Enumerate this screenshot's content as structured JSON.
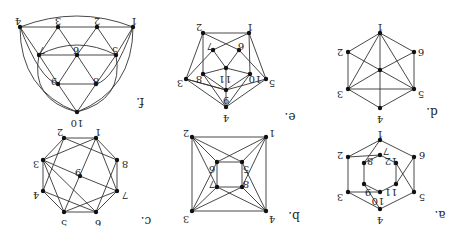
{
  "orientation": "rotated-180",
  "style": {
    "edge_color": "#333333",
    "node_color": "#111111",
    "background": "#ffffff"
  },
  "graphs": [
    {
      "id": "a",
      "caption": "a.",
      "caption_pos": [
        440,
        214
      ],
      "nodes": [
        {
          "id": "1",
          "x": 380,
          "y": 140,
          "lx": 380,
          "ly": 133
        },
        {
          "id": "2",
          "x": 348,
          "y": 157,
          "lx": 340,
          "ly": 154
        },
        {
          "id": "6",
          "x": 414,
          "y": 157,
          "lx": 422,
          "ly": 154
        },
        {
          "id": "7",
          "x": 380,
          "y": 155,
          "lx": 386,
          "ly": 150
        },
        {
          "id": "8",
          "x": 364,
          "y": 163,
          "lx": 370,
          "ly": 160
        },
        {
          "id": "12",
          "x": 396,
          "y": 163,
          "lx": 391,
          "ly": 160
        },
        {
          "id": "11",
          "x": 396,
          "y": 184,
          "lx": 391,
          "ly": 191
        },
        {
          "id": "9",
          "x": 364,
          "y": 184,
          "lx": 368,
          "ly": 191
        },
        {
          "id": "10",
          "x": 380,
          "y": 192,
          "lx": 378,
          "ly": 200
        },
        {
          "id": "3",
          "x": 348,
          "y": 192,
          "lx": 340,
          "ly": 196
        },
        {
          "id": "5",
          "x": 414,
          "y": 192,
          "lx": 422,
          "ly": 196
        },
        {
          "id": "4",
          "x": 380,
          "y": 209,
          "lx": 380,
          "ly": 219
        }
      ],
      "edges": [
        [
          "1",
          "2"
        ],
        [
          "1",
          "6"
        ],
        [
          "2",
          "3"
        ],
        [
          "6",
          "5"
        ],
        [
          "3",
          "4"
        ],
        [
          "5",
          "4"
        ],
        [
          "7",
          "8"
        ],
        [
          "7",
          "12"
        ],
        [
          "8",
          "9"
        ],
        [
          "12",
          "11"
        ],
        [
          "9",
          "10"
        ],
        [
          "11",
          "10"
        ],
        [
          "1",
          "8"
        ],
        [
          "2",
          "7"
        ],
        [
          "6",
          "11"
        ],
        [
          "5",
          "12"
        ],
        [
          "4",
          "9"
        ],
        [
          "3",
          "10"
        ]
      ]
    },
    {
      "id": "b",
      "caption": "b.",
      "caption_pos": [
        294,
        215
      ],
      "nodes": [
        {
          "id": "1",
          "x": 266,
          "y": 137,
          "lx": 272,
          "ly": 132
        },
        {
          "id": "2",
          "x": 192,
          "y": 137,
          "lx": 186,
          "ly": 132
        },
        {
          "id": "5",
          "x": 242,
          "y": 162,
          "lx": 246,
          "ly": 168
        },
        {
          "id": "6",
          "x": 217,
          "y": 162,
          "lx": 212,
          "ly": 168
        },
        {
          "id": "8",
          "x": 242,
          "y": 187,
          "lx": 246,
          "ly": 183
        },
        {
          "id": "7",
          "x": 217,
          "y": 187,
          "lx": 212,
          "ly": 183
        },
        {
          "id": "4",
          "x": 266,
          "y": 211,
          "lx": 272,
          "ly": 218
        },
        {
          "id": "3",
          "x": 192,
          "y": 211,
          "lx": 186,
          "ly": 218
        }
      ],
      "edges": [
        [
          "1",
          "2"
        ],
        [
          "2",
          "3"
        ],
        [
          "3",
          "4"
        ],
        [
          "4",
          "1"
        ],
        [
          "5",
          "6"
        ],
        [
          "6",
          "7"
        ],
        [
          "7",
          "8"
        ],
        [
          "8",
          "5"
        ],
        [
          "1",
          "5"
        ],
        [
          "1",
          "6"
        ],
        [
          "1",
          "8"
        ],
        [
          "2",
          "6"
        ],
        [
          "2",
          "5"
        ],
        [
          "2",
          "7"
        ],
        [
          "3",
          "7"
        ],
        [
          "3",
          "6"
        ],
        [
          "3",
          "8"
        ],
        [
          "4",
          "8"
        ],
        [
          "4",
          "7"
        ],
        [
          "4",
          "5"
        ]
      ]
    },
    {
      "id": "c",
      "caption": "c.",
      "caption_pos": [
        146,
        220
      ],
      "nodes": [
        {
          "id": "1",
          "x": 96,
          "y": 138,
          "lx": 98,
          "ly": 131
        },
        {
          "id": "2",
          "x": 64,
          "y": 138,
          "lx": 60,
          "ly": 131
        },
        {
          "id": "8",
          "x": 117,
          "y": 160,
          "lx": 125,
          "ly": 163
        },
        {
          "id": "3",
          "x": 43,
          "y": 160,
          "lx": 36,
          "ly": 163
        },
        {
          "id": "9",
          "x": 80,
          "y": 176,
          "lx": 78,
          "ly": 171
        },
        {
          "id": "7",
          "x": 117,
          "y": 191,
          "lx": 125,
          "ly": 194
        },
        {
          "id": "4",
          "x": 43,
          "y": 191,
          "lx": 36,
          "ly": 194
        },
        {
          "id": "6",
          "x": 96,
          "y": 212,
          "lx": 98,
          "ly": 222
        },
        {
          "id": "5",
          "x": 64,
          "y": 212,
          "lx": 64,
          "ly": 222
        }
      ],
      "edges": [
        [
          "1",
          "2"
        ],
        [
          "2",
          "3"
        ],
        [
          "3",
          "4"
        ],
        [
          "4",
          "5"
        ],
        [
          "5",
          "6"
        ],
        [
          "6",
          "7"
        ],
        [
          "7",
          "8"
        ],
        [
          "8",
          "1"
        ],
        [
          "1",
          "3"
        ],
        [
          "1",
          "5"
        ],
        [
          "2",
          "8"
        ],
        [
          "2",
          "4"
        ],
        [
          "3",
          "9"
        ],
        [
          "9",
          "7"
        ],
        [
          "4",
          "6"
        ],
        [
          "5",
          "7"
        ],
        [
          "6",
          "8"
        ],
        [
          "3",
          "5"
        ],
        [
          "7",
          "1"
        ],
        [
          "6",
          "3"
        ]
      ]
    },
    {
      "id": "d",
      "caption": "d.",
      "caption_pos": [
        432,
        111
      ],
      "nodes": [
        {
          "id": "1",
          "x": 380,
          "y": 33,
          "lx": 380,
          "ly": 26
        },
        {
          "id": "2",
          "x": 348,
          "y": 52,
          "lx": 340,
          "ly": 51
        },
        {
          "id": "6",
          "x": 414,
          "y": 52,
          "lx": 421,
          "ly": 51
        },
        {
          "id": "c",
          "x": 380,
          "y": 70,
          "lx": null,
          "ly": null
        },
        {
          "id": "3",
          "x": 348,
          "y": 89,
          "lx": 340,
          "ly": 93
        },
        {
          "id": "5",
          "x": 414,
          "y": 89,
          "lx": 421,
          "ly": 93
        },
        {
          "id": "4",
          "x": 380,
          "y": 108,
          "lx": 380,
          "ly": 118
        }
      ],
      "edges": [
        [
          "1",
          "2"
        ],
        [
          "1",
          "6"
        ],
        [
          "2",
          "3"
        ],
        [
          "6",
          "5"
        ],
        [
          "3",
          "4"
        ],
        [
          "5",
          "4"
        ],
        [
          "3",
          "5"
        ],
        [
          "1",
          "3"
        ],
        [
          "1",
          "5"
        ],
        [
          "1",
          "4"
        ],
        [
          "2",
          "c"
        ],
        [
          "c",
          "5"
        ],
        [
          "6",
          "c"
        ],
        [
          "c",
          "3"
        ]
      ]
    },
    {
      "id": "e",
      "caption": "e.",
      "caption_pos": [
        290,
        116
      ],
      "nodes": [
        {
          "id": "1",
          "x": 249,
          "y": 33,
          "lx": 250,
          "ly": 26
        },
        {
          "id": "2",
          "x": 203,
          "y": 33,
          "lx": 199,
          "ly": 26
        },
        {
          "id": "7",
          "x": 213,
          "y": 50,
          "lx": 210,
          "ly": 45
        },
        {
          "id": "6",
          "x": 239,
          "y": 50,
          "lx": 241,
          "ly": 45
        },
        {
          "id": "11",
          "x": 226,
          "y": 68,
          "lx": 225,
          "ly": 78
        },
        {
          "id": "8",
          "x": 203,
          "y": 74,
          "lx": 199,
          "ly": 78
        },
        {
          "id": "10",
          "x": 250,
          "y": 74,
          "lx": 255,
          "ly": 78
        },
        {
          "id": "3",
          "x": 186,
          "y": 79,
          "lx": 180,
          "ly": 82
        },
        {
          "id": "5",
          "x": 266,
          "y": 79,
          "lx": 272,
          "ly": 82
        },
        {
          "id": "9",
          "x": 226,
          "y": 90,
          "lx": 226,
          "ly": 99
        },
        {
          "id": "4",
          "x": 226,
          "y": 107,
          "lx": 226,
          "ly": 117
        }
      ],
      "edges": [
        [
          "1",
          "2"
        ],
        [
          "1",
          "5"
        ],
        [
          "2",
          "3"
        ],
        [
          "3",
          "4"
        ],
        [
          "5",
          "4"
        ],
        [
          "2",
          "8"
        ],
        [
          "1",
          "10"
        ],
        [
          "2",
          "6"
        ],
        [
          "1",
          "7"
        ],
        [
          "7",
          "3"
        ],
        [
          "6",
          "5"
        ],
        [
          "7",
          "11"
        ],
        [
          "6",
          "11"
        ],
        [
          "8",
          "11"
        ],
        [
          "10",
          "11"
        ],
        [
          "11",
          "9"
        ],
        [
          "8",
          "9"
        ],
        [
          "10",
          "9"
        ],
        [
          "9",
          "3"
        ],
        [
          "9",
          "5"
        ],
        [
          "8",
          "4"
        ],
        [
          "10",
          "4"
        ],
        [
          "3",
          "9"
        ],
        [
          "4",
          "9"
        ]
      ]
    },
    {
      "id": "f",
      "caption": "f.",
      "caption_pos": [
        140,
        101
      ],
      "nodes": [
        {
          "id": "4",
          "x": 20,
          "y": 27,
          "lx": 18,
          "ly": 20
        },
        {
          "id": "3",
          "x": 58,
          "y": 27,
          "lx": 58,
          "ly": 20
        },
        {
          "id": "2",
          "x": 97,
          "y": 27,
          "lx": 97,
          "ly": 20
        },
        {
          "id": "1",
          "x": 133,
          "y": 27,
          "lx": 134,
          "ly": 20
        },
        {
          "id": "7",
          "x": 39,
          "y": 55,
          "lx": 42,
          "ly": 49
        },
        {
          "id": "6",
          "x": 77,
          "y": 55,
          "lx": 76,
          "ly": 49
        },
        {
          "id": "5",
          "x": 116,
          "y": 55,
          "lx": 115,
          "ly": 49
        },
        {
          "id": "9",
          "x": 58,
          "y": 84,
          "lx": 54,
          "ly": 80
        },
        {
          "id": "8",
          "x": 96,
          "y": 84,
          "lx": 96,
          "ly": 80
        },
        {
          "id": "10",
          "x": 77,
          "y": 112,
          "lx": 77,
          "ly": 122
        }
      ],
      "edges": [
        [
          "4",
          "3"
        ],
        [
          "3",
          "2"
        ],
        [
          "2",
          "1"
        ],
        [
          "4",
          "7"
        ],
        [
          "3",
          "7"
        ],
        [
          "3",
          "6"
        ],
        [
          "2",
          "6"
        ],
        [
          "2",
          "5"
        ],
        [
          "1",
          "5"
        ],
        [
          "7",
          "6"
        ],
        [
          "6",
          "5"
        ],
        [
          "7",
          "9"
        ],
        [
          "6",
          "9"
        ],
        [
          "6",
          "8"
        ],
        [
          "5",
          "8"
        ],
        [
          "9",
          "8"
        ],
        [
          "9",
          "10"
        ],
        [
          "8",
          "10"
        ]
      ],
      "arcs": [
        {
          "d": "M20,27 Q77,5 133,27"
        },
        {
          "d": "M39,55 Q77,35 116,55"
        },
        {
          "d": "M20,27 Q20,90 77,112"
        },
        {
          "d": "M133,27 Q133,90 77,112"
        },
        {
          "d": "M39,55 Q30,100 77,112"
        },
        {
          "d": "M116,55 Q124,100 77,112"
        },
        {
          "d": "M20,27 Q40,80 58,84"
        },
        {
          "d": "M133,27 Q114,80 96,84"
        }
      ]
    }
  ]
}
